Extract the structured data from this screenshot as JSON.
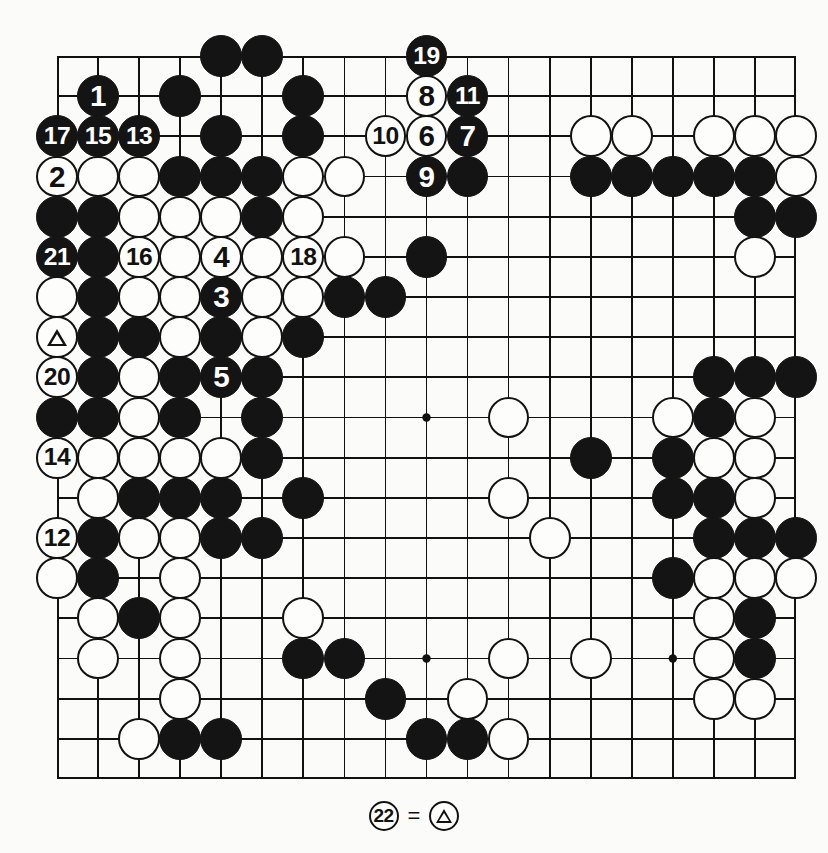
{
  "diagram": {
    "type": "go-board-diagram",
    "board_size": 19,
    "geometry": {
      "left": 57,
      "top": 56,
      "width": 739,
      "height": 723,
      "cols": 19,
      "rows": 19
    },
    "colors": {
      "black_stone": "#141414",
      "white_stone": "#fdfdfb",
      "line": "#111111",
      "background": "#fbfbf9",
      "label_on_black": "#ffffff",
      "label_on_white": "#111111"
    },
    "star_points": [
      [
        3,
        3
      ],
      [
        9,
        3
      ],
      [
        15,
        3
      ],
      [
        3,
        9
      ],
      [
        9,
        9
      ],
      [
        15,
        9
      ],
      [
        3,
        15
      ],
      [
        9,
        15
      ],
      [
        15,
        15
      ]
    ],
    "stones": [
      {
        "c": 4,
        "r": 0,
        "color": "black",
        "label": ""
      },
      {
        "c": 5,
        "r": 0,
        "color": "black",
        "label": ""
      },
      {
        "c": 9,
        "r": 0,
        "color": "black",
        "label": "19"
      },
      {
        "c": 1,
        "r": 1,
        "color": "black",
        "label": "1"
      },
      {
        "c": 3,
        "r": 1,
        "color": "black",
        "label": ""
      },
      {
        "c": 6,
        "r": 1,
        "color": "black",
        "label": ""
      },
      {
        "c": 9,
        "r": 1,
        "color": "white",
        "label": "8"
      },
      {
        "c": 10,
        "r": 1,
        "color": "black",
        "label": "11"
      },
      {
        "c": 0,
        "r": 2,
        "color": "black",
        "label": "17"
      },
      {
        "c": 1,
        "r": 2,
        "color": "black",
        "label": "15"
      },
      {
        "c": 2,
        "r": 2,
        "color": "black",
        "label": "13"
      },
      {
        "c": 4,
        "r": 2,
        "color": "black",
        "label": ""
      },
      {
        "c": 6,
        "r": 2,
        "color": "black",
        "label": ""
      },
      {
        "c": 8,
        "r": 2,
        "color": "white",
        "label": "10"
      },
      {
        "c": 9,
        "r": 2,
        "color": "white",
        "label": "6"
      },
      {
        "c": 10,
        "r": 2,
        "color": "black",
        "label": "7"
      },
      {
        "c": 13,
        "r": 2,
        "color": "white",
        "label": ""
      },
      {
        "c": 14,
        "r": 2,
        "color": "white",
        "label": ""
      },
      {
        "c": 16,
        "r": 2,
        "color": "white",
        "label": ""
      },
      {
        "c": 17,
        "r": 2,
        "color": "white",
        "label": ""
      },
      {
        "c": 18,
        "r": 2,
        "color": "white",
        "label": ""
      },
      {
        "c": 0,
        "r": 3,
        "color": "white",
        "label": "2"
      },
      {
        "c": 1,
        "r": 3,
        "color": "white",
        "label": ""
      },
      {
        "c": 2,
        "r": 3,
        "color": "white",
        "label": ""
      },
      {
        "c": 3,
        "r": 3,
        "color": "black",
        "label": ""
      },
      {
        "c": 4,
        "r": 3,
        "color": "black",
        "label": ""
      },
      {
        "c": 5,
        "r": 3,
        "color": "black",
        "label": ""
      },
      {
        "c": 6,
        "r": 3,
        "color": "white",
        "label": ""
      },
      {
        "c": 7,
        "r": 3,
        "color": "white",
        "label": ""
      },
      {
        "c": 9,
        "r": 3,
        "color": "black",
        "label": "9"
      },
      {
        "c": 10,
        "r": 3,
        "color": "black",
        "label": ""
      },
      {
        "c": 13,
        "r": 3,
        "color": "black",
        "label": ""
      },
      {
        "c": 14,
        "r": 3,
        "color": "black",
        "label": ""
      },
      {
        "c": 15,
        "r": 3,
        "color": "black",
        "label": ""
      },
      {
        "c": 16,
        "r": 3,
        "color": "black",
        "label": ""
      },
      {
        "c": 17,
        "r": 3,
        "color": "black",
        "label": ""
      },
      {
        "c": 18,
        "r": 3,
        "color": "white",
        "label": ""
      },
      {
        "c": 0,
        "r": 4,
        "color": "black",
        "label": ""
      },
      {
        "c": 1,
        "r": 4,
        "color": "black",
        "label": ""
      },
      {
        "c": 2,
        "r": 4,
        "color": "white",
        "label": ""
      },
      {
        "c": 3,
        "r": 4,
        "color": "white",
        "label": ""
      },
      {
        "c": 4,
        "r": 4,
        "color": "white",
        "label": ""
      },
      {
        "c": 5,
        "r": 4,
        "color": "black",
        "label": ""
      },
      {
        "c": 6,
        "r": 4,
        "color": "white",
        "label": ""
      },
      {
        "c": 17,
        "r": 4,
        "color": "black",
        "label": ""
      },
      {
        "c": 18,
        "r": 4,
        "color": "black",
        "label": ""
      },
      {
        "c": 0,
        "r": 5,
        "color": "black",
        "label": "21"
      },
      {
        "c": 1,
        "r": 5,
        "color": "black",
        "label": ""
      },
      {
        "c": 2,
        "r": 5,
        "color": "white",
        "label": "16"
      },
      {
        "c": 3,
        "r": 5,
        "color": "white",
        "label": ""
      },
      {
        "c": 4,
        "r": 5,
        "color": "white",
        "label": "4"
      },
      {
        "c": 5,
        "r": 5,
        "color": "white",
        "label": ""
      },
      {
        "c": 6,
        "r": 5,
        "color": "white",
        "label": "18"
      },
      {
        "c": 7,
        "r": 5,
        "color": "white",
        "label": ""
      },
      {
        "c": 9,
        "r": 5,
        "color": "black",
        "label": ""
      },
      {
        "c": 17,
        "r": 5,
        "color": "white",
        "label": ""
      },
      {
        "c": 0,
        "r": 6,
        "color": "white",
        "label": ""
      },
      {
        "c": 1,
        "r": 6,
        "color": "black",
        "label": ""
      },
      {
        "c": 2,
        "r": 6,
        "color": "white",
        "label": ""
      },
      {
        "c": 3,
        "r": 6,
        "color": "white",
        "label": ""
      },
      {
        "c": 4,
        "r": 6,
        "color": "black",
        "label": "3"
      },
      {
        "c": 5,
        "r": 6,
        "color": "white",
        "label": ""
      },
      {
        "c": 6,
        "r": 6,
        "color": "white",
        "label": ""
      },
      {
        "c": 7,
        "r": 6,
        "color": "black",
        "label": ""
      },
      {
        "c": 8,
        "r": 6,
        "color": "black",
        "label": ""
      },
      {
        "c": 0,
        "r": 7,
        "color": "white",
        "label": "",
        "marker": "triangle"
      },
      {
        "c": 1,
        "r": 7,
        "color": "black",
        "label": ""
      },
      {
        "c": 2,
        "r": 7,
        "color": "black",
        "label": ""
      },
      {
        "c": 3,
        "r": 7,
        "color": "white",
        "label": ""
      },
      {
        "c": 4,
        "r": 7,
        "color": "black",
        "label": ""
      },
      {
        "c": 5,
        "r": 7,
        "color": "white",
        "label": ""
      },
      {
        "c": 6,
        "r": 7,
        "color": "black",
        "label": ""
      },
      {
        "c": 0,
        "r": 8,
        "color": "white",
        "label": "20"
      },
      {
        "c": 1,
        "r": 8,
        "color": "black",
        "label": ""
      },
      {
        "c": 2,
        "r": 8,
        "color": "white",
        "label": ""
      },
      {
        "c": 3,
        "r": 8,
        "color": "black",
        "label": ""
      },
      {
        "c": 4,
        "r": 8,
        "color": "black",
        "label": "5"
      },
      {
        "c": 5,
        "r": 8,
        "color": "black",
        "label": ""
      },
      {
        "c": 16,
        "r": 8,
        "color": "black",
        "label": ""
      },
      {
        "c": 17,
        "r": 8,
        "color": "black",
        "label": ""
      },
      {
        "c": 18,
        "r": 8,
        "color": "black",
        "label": ""
      },
      {
        "c": 0,
        "r": 9,
        "color": "black",
        "label": ""
      },
      {
        "c": 1,
        "r": 9,
        "color": "black",
        "label": ""
      },
      {
        "c": 2,
        "r": 9,
        "color": "white",
        "label": ""
      },
      {
        "c": 3,
        "r": 9,
        "color": "black",
        "label": ""
      },
      {
        "c": 5,
        "r": 9,
        "color": "black",
        "label": ""
      },
      {
        "c": 11,
        "r": 9,
        "color": "white",
        "label": ""
      },
      {
        "c": 15,
        "r": 9,
        "color": "white",
        "label": ""
      },
      {
        "c": 16,
        "r": 9,
        "color": "black",
        "label": ""
      },
      {
        "c": 17,
        "r": 9,
        "color": "white",
        "label": ""
      },
      {
        "c": 0,
        "r": 10,
        "color": "white",
        "label": "14"
      },
      {
        "c": 1,
        "r": 10,
        "color": "white",
        "label": ""
      },
      {
        "c": 2,
        "r": 10,
        "color": "white",
        "label": ""
      },
      {
        "c": 3,
        "r": 10,
        "color": "white",
        "label": ""
      },
      {
        "c": 4,
        "r": 10,
        "color": "white",
        "label": ""
      },
      {
        "c": 5,
        "r": 10,
        "color": "black",
        "label": ""
      },
      {
        "c": 13,
        "r": 10,
        "color": "black",
        "label": ""
      },
      {
        "c": 15,
        "r": 10,
        "color": "black",
        "label": ""
      },
      {
        "c": 16,
        "r": 10,
        "color": "white",
        "label": ""
      },
      {
        "c": 17,
        "r": 10,
        "color": "white",
        "label": ""
      },
      {
        "c": 1,
        "r": 11,
        "color": "white",
        "label": ""
      },
      {
        "c": 2,
        "r": 11,
        "color": "black",
        "label": ""
      },
      {
        "c": 3,
        "r": 11,
        "color": "black",
        "label": ""
      },
      {
        "c": 4,
        "r": 11,
        "color": "black",
        "label": ""
      },
      {
        "c": 6,
        "r": 11,
        "color": "black",
        "label": ""
      },
      {
        "c": 11,
        "r": 11,
        "color": "white",
        "label": ""
      },
      {
        "c": 15,
        "r": 11,
        "color": "black",
        "label": ""
      },
      {
        "c": 16,
        "r": 11,
        "color": "black",
        "label": ""
      },
      {
        "c": 17,
        "r": 11,
        "color": "white",
        "label": ""
      },
      {
        "c": 0,
        "r": 12,
        "color": "white",
        "label": "12"
      },
      {
        "c": 1,
        "r": 12,
        "color": "black",
        "label": ""
      },
      {
        "c": 2,
        "r": 12,
        "color": "white",
        "label": ""
      },
      {
        "c": 3,
        "r": 12,
        "color": "white",
        "label": ""
      },
      {
        "c": 4,
        "r": 12,
        "color": "black",
        "label": ""
      },
      {
        "c": 5,
        "r": 12,
        "color": "black",
        "label": ""
      },
      {
        "c": 12,
        "r": 12,
        "color": "white",
        "label": ""
      },
      {
        "c": 16,
        "r": 12,
        "color": "black",
        "label": ""
      },
      {
        "c": 17,
        "r": 12,
        "color": "black",
        "label": ""
      },
      {
        "c": 18,
        "r": 12,
        "color": "black",
        "label": ""
      },
      {
        "c": 0,
        "r": 13,
        "color": "white",
        "label": ""
      },
      {
        "c": 1,
        "r": 13,
        "color": "black",
        "label": ""
      },
      {
        "c": 3,
        "r": 13,
        "color": "white",
        "label": ""
      },
      {
        "c": 15,
        "r": 13,
        "color": "black",
        "label": ""
      },
      {
        "c": 16,
        "r": 13,
        "color": "white",
        "label": ""
      },
      {
        "c": 17,
        "r": 13,
        "color": "white",
        "label": ""
      },
      {
        "c": 18,
        "r": 13,
        "color": "white",
        "label": ""
      },
      {
        "c": 1,
        "r": 14,
        "color": "white",
        "label": ""
      },
      {
        "c": 2,
        "r": 14,
        "color": "black",
        "label": ""
      },
      {
        "c": 3,
        "r": 14,
        "color": "white",
        "label": ""
      },
      {
        "c": 6,
        "r": 14,
        "color": "white",
        "label": ""
      },
      {
        "c": 16,
        "r": 14,
        "color": "white",
        "label": ""
      },
      {
        "c": 17,
        "r": 14,
        "color": "black",
        "label": ""
      },
      {
        "c": 1,
        "r": 15,
        "color": "white",
        "label": ""
      },
      {
        "c": 3,
        "r": 15,
        "color": "white",
        "label": ""
      },
      {
        "c": 6,
        "r": 15,
        "color": "black",
        "label": ""
      },
      {
        "c": 7,
        "r": 15,
        "color": "black",
        "label": ""
      },
      {
        "c": 11,
        "r": 15,
        "color": "white",
        "label": ""
      },
      {
        "c": 13,
        "r": 15,
        "color": "white",
        "label": ""
      },
      {
        "c": 16,
        "r": 15,
        "color": "white",
        "label": ""
      },
      {
        "c": 17,
        "r": 15,
        "color": "black",
        "label": ""
      },
      {
        "c": 3,
        "r": 16,
        "color": "white",
        "label": ""
      },
      {
        "c": 8,
        "r": 16,
        "color": "black",
        "label": ""
      },
      {
        "c": 10,
        "r": 16,
        "color": "white",
        "label": ""
      },
      {
        "c": 16,
        "r": 16,
        "color": "white",
        "label": ""
      },
      {
        "c": 17,
        "r": 16,
        "color": "white",
        "label": ""
      },
      {
        "c": 2,
        "r": 17,
        "color": "white",
        "label": ""
      },
      {
        "c": 3,
        "r": 17,
        "color": "black",
        "label": ""
      },
      {
        "c": 4,
        "r": 17,
        "color": "black",
        "label": ""
      },
      {
        "c": 9,
        "r": 17,
        "color": "black",
        "label": ""
      },
      {
        "c": 10,
        "r": 17,
        "color": "black",
        "label": ""
      },
      {
        "c": 11,
        "r": 17,
        "color": "white",
        "label": ""
      }
    ]
  },
  "caption": {
    "move_number": "22",
    "equals": "=",
    "reference_marker": "triangle",
    "text": "22 = triangle"
  }
}
